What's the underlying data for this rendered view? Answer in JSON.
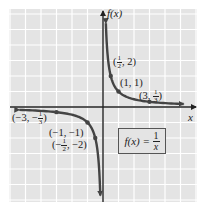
{
  "chart_data": {
    "type": "line",
    "title": "",
    "function": "f(x) = 1/x",
    "xlabel": "x",
    "ylabel": "f(x)",
    "grid": true,
    "xlim": [
      -6,
      6
    ],
    "ylim": [
      -6,
      6
    ],
    "series": [
      {
        "name": "f(x) = 1/x (x > 0)",
        "points": [
          [
            0.1667,
            6
          ],
          [
            0.5,
            2
          ],
          [
            1,
            1
          ],
          [
            3,
            0.3333
          ],
          [
            5,
            0.2
          ]
        ]
      },
      {
        "name": "f(x) = 1/x (x < 0)",
        "points": [
          [
            -5.5,
            -0.1818
          ],
          [
            -3,
            -0.3333
          ],
          [
            -1,
            -1
          ],
          [
            -0.5,
            -2
          ],
          [
            -0.18,
            -5.5
          ]
        ]
      }
    ],
    "marked_points": [
      {
        "x": 0.5,
        "y": 2,
        "label": "(1/2, 2)"
      },
      {
        "x": 1,
        "y": 1,
        "label": "(1, 1)"
      },
      {
        "x": 3,
        "y": 0.3333,
        "label": "(3, 1/3)"
      },
      {
        "x": -3,
        "y": -0.3333,
        "label": "(-3, -1/3)"
      },
      {
        "x": -1,
        "y": -1,
        "label": "(-1, -1)"
      },
      {
        "x": -0.5,
        "y": -2,
        "label": "(-1/2, -2)"
      }
    ],
    "annotations": [
      "f(x) = 1/x"
    ]
  },
  "labels": {
    "y_axis": "f(x)",
    "x_axis": "x",
    "p1": {
      "open": "(",
      "num": "1",
      "den": "2",
      "rest": ", 2)"
    },
    "p2": "(1, 1)",
    "p3": {
      "pre": "(3, ",
      "num": "1",
      "den": "3",
      "close": ")"
    },
    "p4": {
      "pre": "(−3, −",
      "num": "1",
      "den": "3",
      "close": ")"
    },
    "p5": "(−1, −1)",
    "p6": {
      "pre": "(−",
      "num": "1",
      "den": "2",
      "rest": ", −2)"
    },
    "equation": {
      "lhs": "f(x) = ",
      "num": "1",
      "den": "x"
    }
  },
  "colors": {
    "grid_bg": "#e4e4e4",
    "grid_line": "#ffffff",
    "axis": "#222222",
    "curve": "#444444"
  }
}
